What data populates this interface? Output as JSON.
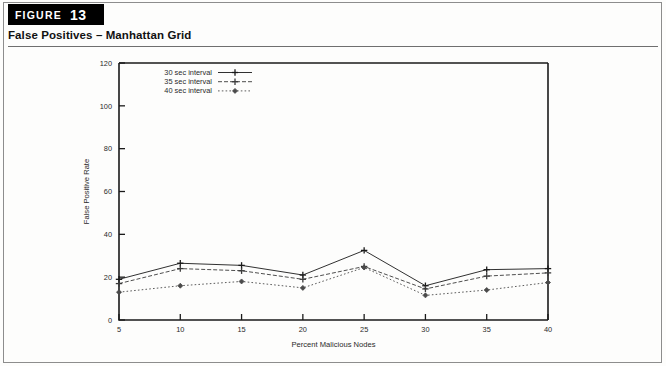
{
  "figure": {
    "badge_word": "FIGURE",
    "badge_number": "13",
    "title": "False Positives – Manhattan Grid"
  },
  "chart_data": {
    "type": "line",
    "title": "",
    "xlabel": "Percent Malicious Nodes",
    "ylabel": "False Positive Rate",
    "x": [
      5,
      10,
      15,
      20,
      25,
      30,
      35,
      40
    ],
    "xlim": [
      5,
      40
    ],
    "ylim": [
      0,
      120
    ],
    "xticks": [
      "5",
      "10",
      "15",
      "20",
      "25",
      "30",
      "35",
      "40"
    ],
    "yticks": [
      "0",
      "20",
      "40",
      "60",
      "80",
      "100",
      "120"
    ],
    "grid": false,
    "legend_position": "top-left",
    "series": [
      {
        "name": "30 sec interval",
        "values": [
          19,
          26.5,
          25.5,
          21,
          32.5,
          16,
          23.5,
          24
        ],
        "style": "solid",
        "marker": "plus",
        "color": "#1a1a1a"
      },
      {
        "name": "35 sec interval",
        "values": [
          17,
          24,
          23,
          19,
          25,
          14.5,
          20.5,
          22
        ],
        "style": "dashed",
        "marker": "plus",
        "color": "#3a3a3a"
      },
      {
        "name": "40 sec interval",
        "values": [
          13,
          16,
          18,
          15,
          24.5,
          11.5,
          14,
          17.5
        ],
        "style": "dotted",
        "marker": "diamond",
        "color": "#4a4a4a"
      }
    ]
  },
  "legend": {
    "items": [
      {
        "label": "30 sec interval"
      },
      {
        "label": "35 sec interval"
      },
      {
        "label": "40 sec interval"
      }
    ]
  }
}
